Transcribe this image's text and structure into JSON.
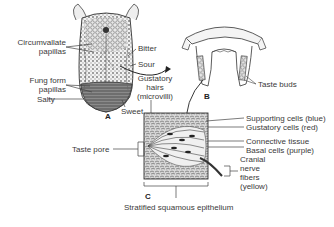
{
  "figure": {
    "panels": [
      {
        "id": "A",
        "subject": "Tongue (dorsal surface)"
      },
      {
        "id": "B",
        "subject": "Papilla cross-section"
      },
      {
        "id": "C",
        "subject": "Taste bud"
      }
    ],
    "panel_labels": {
      "a": "A",
      "b": "B",
      "c": "C"
    },
    "tongue_labels": {
      "circumvallate_1": "Circumvallate",
      "circumvallate_2": "papillas",
      "fungiform_1": "Fung form",
      "fungiform_2": "papillas",
      "bitter": "Bitter",
      "sour": "Sour",
      "salty": "Salty",
      "sweet": "Sweet",
      "gustatory_1": "Gustatory",
      "gustatory_2": "hairs",
      "gustatory_3": "(microvilli)"
    },
    "papilla_labels": {
      "taste_buds": "Taste buds"
    },
    "taste_bud_labels": {
      "taste_pore": "Taste pore",
      "supporting": "Supporting cells (blue)",
      "gustatory_cells": "Gustatory cells (red)",
      "connective": "Connective tissue",
      "basal": "Basal cells (purple)",
      "cranial_1": "Cranial",
      "cranial_2": "nerve",
      "cranial_3": "fibers",
      "cranial_4": "(yellow)",
      "epithelium": "Stratified squamous epithelium"
    }
  }
}
